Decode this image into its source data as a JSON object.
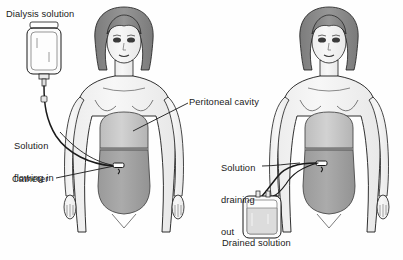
{
  "figure": {
    "background_color": "#fefefe",
    "line_color": "#1a1a1a",
    "skin_fill": "#f2f2f2",
    "hair_fill": "#8a8a8a",
    "cavity_upper_fill": "#c9c9c9",
    "cavity_lower_fill": "#a3a3a3",
    "bag_fill": "#fbfbfb",
    "drained_fluid_fill": "#dcdcdc"
  },
  "panels": [
    {
      "id": "inflow",
      "name": "solution-flowing-in-panel",
      "labels": [
        {
          "id": "dialysis-solution",
          "text": "Dialysis solution",
          "x": 6,
          "y": 9,
          "lines": [
            "Dialysis solution"
          ]
        },
        {
          "id": "solution-flowing-in",
          "text": "Solution flowing in",
          "x": 14,
          "y": 120,
          "lines": [
            "Solution",
            "flowing in"
          ]
        },
        {
          "id": "catheter",
          "text": "Catheter",
          "x": 12,
          "y": 174,
          "lines": [
            "Catheter"
          ]
        }
      ],
      "elements": [
        "dialysis-solution-bag",
        "inflow-tubing",
        "catheter-port",
        "patient-figure",
        "peritoneal-cavity"
      ]
    },
    {
      "id": "drainage",
      "name": "solution-draining-out-panel",
      "labels": [
        {
          "id": "solution-draining-out",
          "text": "Solution draining out",
          "x": 221,
          "y": 142,
          "lines": [
            "Solution",
            "draining",
            "out"
          ]
        },
        {
          "id": "drained-solution",
          "text": "Drained solution",
          "x": 222,
          "y": 238,
          "lines": [
            "Drained solution"
          ]
        }
      ],
      "elements": [
        "drained-solution-bag",
        "outflow-tubing",
        "catheter-port",
        "patient-figure",
        "peritoneal-cavity"
      ]
    }
  ],
  "shared_labels": [
    {
      "id": "peritoneal-cavity",
      "text": "Peritoneal cavity",
      "x": 189,
      "y": 97,
      "lines": [
        "Peritoneal cavity"
      ]
    }
  ],
  "bottom_caption": {
    "text": "",
    "visible_fragment": ""
  }
}
